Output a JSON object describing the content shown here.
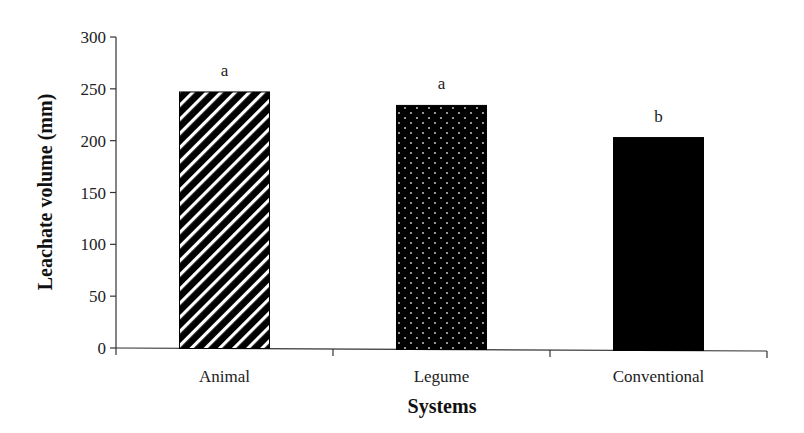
{
  "chart_data": {
    "type": "bar",
    "title": "",
    "xlabel": "Systems",
    "ylabel": "Leachate volume (mm)",
    "ylim": [
      0,
      300
    ],
    "yticks": [
      0,
      50,
      100,
      150,
      200,
      250,
      300
    ],
    "grid": false,
    "legend": null,
    "categories": [
      "Animal",
      "Legume",
      "Conventional"
    ],
    "values": [
      247,
      234,
      203
    ],
    "significance_letters": [
      "a",
      "a",
      "b"
    ],
    "bar_patterns": [
      "diagonal-stripes",
      "dotted",
      "solid"
    ]
  },
  "colors": {
    "bar_fill": "#000000",
    "axis": "#333333",
    "background": "#ffffff"
  }
}
